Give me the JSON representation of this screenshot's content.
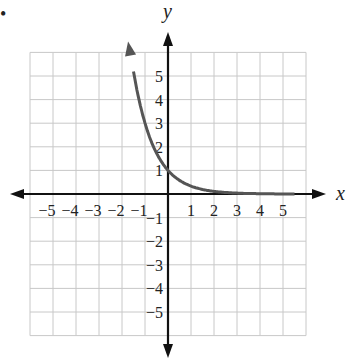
{
  "chart_data": {
    "type": "line",
    "title": "",
    "function": "y = (1/3)^x",
    "xlabel": "x",
    "ylabel": "y",
    "xlim": [
      -6,
      6
    ],
    "ylim": [
      -6,
      6
    ],
    "grid": true,
    "x_ticks": [
      "-5",
      "-4",
      "-3",
      "-2",
      "-1",
      "1",
      "2",
      "3",
      "4",
      "5"
    ],
    "y_ticks": [
      "5",
      "4",
      "3",
      "2",
      "1",
      "-1",
      "-2",
      "-3",
      "-4",
      "-5"
    ],
    "series": [
      {
        "name": "curve",
        "color": "#555555",
        "x": [
          -1.6,
          -1.5,
          -1,
          -0.5,
          0,
          0.5,
          1,
          1.5,
          2,
          2.5,
          3,
          4,
          5.5
        ],
        "y": [
          5.8,
          5.2,
          3,
          1.73,
          1,
          0.58,
          0.33,
          0.19,
          0.11,
          0.06,
          0.04,
          0.01,
          0.002
        ]
      }
    ],
    "annotations": [
      "•"
    ]
  }
}
